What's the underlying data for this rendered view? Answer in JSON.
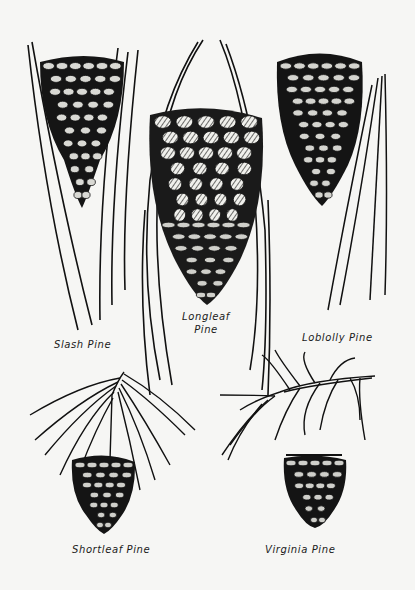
{
  "colors": {
    "ink": "#111111",
    "paper": "#f6f6f4",
    "highlight": "#e8e8e4"
  },
  "specimens": [
    {
      "id": "slash",
      "label": "Slash Pine"
    },
    {
      "id": "longleaf",
      "label_line1": "Longleaf",
      "label_line2": "Pine"
    },
    {
      "id": "loblolly",
      "label": "Loblolly Pine"
    },
    {
      "id": "shortleaf",
      "label": "Shortleaf Pine"
    },
    {
      "id": "virginia",
      "label": "Virginia Pine"
    }
  ]
}
